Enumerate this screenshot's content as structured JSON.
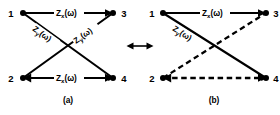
{
  "figure": {
    "type": "circuit-diagram",
    "relation_symbol": "↔",
    "panels": [
      {
        "id": "a",
        "caption": "(a)",
        "nodes": [
          {
            "id": "n1",
            "label": "1",
            "position": "top-left"
          },
          {
            "id": "n3",
            "label": "3",
            "position": "top-right"
          },
          {
            "id": "n2",
            "label": "2",
            "position": "bottom-left"
          },
          {
            "id": "n4",
            "label": "4",
            "position": "bottom-right"
          }
        ],
        "edges": [
          {
            "id": "a-top",
            "from": "1",
            "to": "3",
            "style": "solid",
            "label_base": "Z",
            "label_sub": "x",
            "label_arg": "(ω)",
            "label": "Zₓ(ω)"
          },
          {
            "id": "a-bottom",
            "from": "2",
            "to": "4",
            "style": "solid",
            "label_base": "Z",
            "label_sub": "x",
            "label_arg": "(ω)",
            "label": "Zₓ(ω)"
          },
          {
            "id": "a-diag1",
            "from": "1",
            "to": "4",
            "style": "solid",
            "label_base": "Z",
            "label_sub": "y",
            "label_arg": "(ω)",
            "label": "Zᵧ(ω)"
          },
          {
            "id": "a-diag2",
            "from": "2",
            "to": "3",
            "style": "solid",
            "label_base": "Z",
            "label_sub": "y",
            "label_arg": "(ω)",
            "label": "Zᵧ(ω)"
          }
        ]
      },
      {
        "id": "b",
        "caption": "(b)",
        "nodes": [
          {
            "id": "n1",
            "label": "1",
            "position": "top-left"
          },
          {
            "id": "n3",
            "label": "3",
            "position": "top-right"
          },
          {
            "id": "n2",
            "label": "2",
            "position": "bottom-left"
          },
          {
            "id": "n4",
            "label": "4",
            "position": "bottom-right"
          }
        ],
        "edges": [
          {
            "id": "b-top",
            "from": "1",
            "to": "3",
            "style": "solid",
            "label_base": "Z",
            "label_sub": "x",
            "label_arg": "(ω)",
            "label": "Zₓ(ω)"
          },
          {
            "id": "b-diag1",
            "from": "1",
            "to": "4",
            "style": "solid",
            "label_base": "Z",
            "label_sub": "y",
            "label_arg": "(ω)",
            "label": "Zᵧ(ω)"
          },
          {
            "id": "b-diag2",
            "from": "2",
            "to": "3",
            "style": "dashed",
            "label": ""
          },
          {
            "id": "b-bottom",
            "from": "2",
            "to": "4",
            "style": "dashed",
            "label": ""
          }
        ]
      }
    ]
  },
  "colors": {
    "ink": "#000000",
    "background": "#ffffff"
  }
}
